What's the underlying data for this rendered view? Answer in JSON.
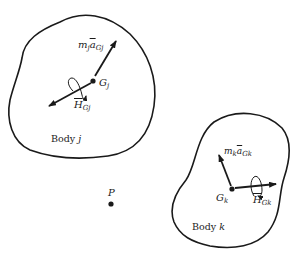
{
  "diagram": {
    "type": "free-body / kinetic diagram of two rigid bodies",
    "stroke_color": "#1a1a1a",
    "background": "#ffffff",
    "body_j": {
      "label_prefix": "Body",
      "label_index": "j",
      "center_label": "G",
      "center_sub": "j",
      "force_vector": {
        "m": "m",
        "m_sub": "j",
        "a": "a",
        "a_sub": "Gj"
      },
      "moment": {
        "H": "H",
        "H_sub": "Gj"
      }
    },
    "body_k": {
      "label_prefix": "Body",
      "label_index": "k",
      "center_label": "G",
      "center_sub": "k",
      "force_vector": {
        "m": "m",
        "m_sub": "k",
        "a": "a",
        "a_sub": "Gk"
      },
      "moment": {
        "H": "H",
        "H_sub": "Gk"
      }
    },
    "point": {
      "label": "P"
    }
  }
}
